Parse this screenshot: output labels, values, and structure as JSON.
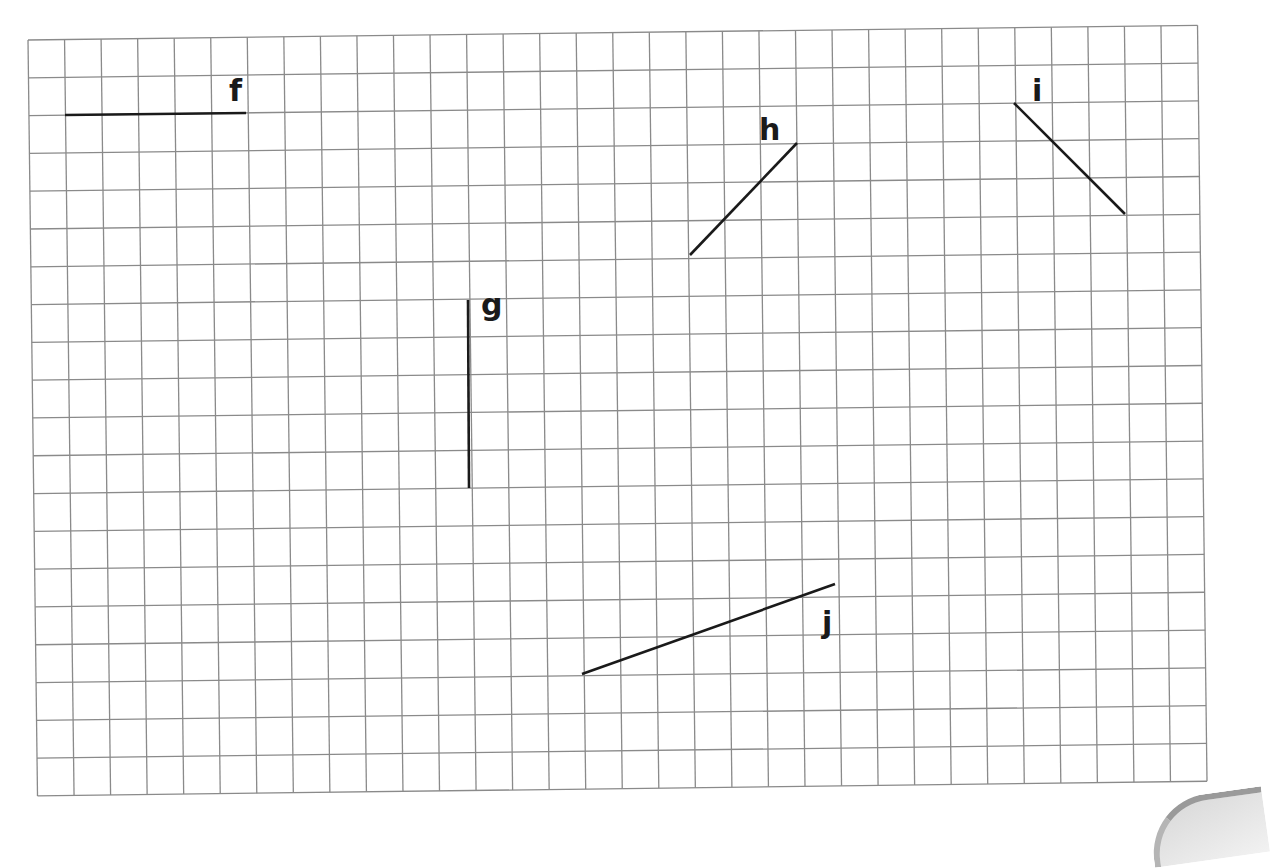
{
  "grid": {
    "origin": [
      28,
      40
    ],
    "cols": 32,
    "rows": 20,
    "cell_w": 36.55,
    "cell_h": 37.8,
    "rotation_deg": -0.72,
    "line_color": "#8a8a8a"
  },
  "segments": [
    {
      "id": "f",
      "label": "f",
      "x1": 65,
      "y1": 115,
      "x2": 246,
      "y2": 113,
      "label_x": 229,
      "label_y": 101
    },
    {
      "id": "g",
      "label": "g",
      "x1": 468,
      "y1": 300,
      "x2": 469,
      "y2": 488,
      "label_x": 481,
      "label_y": 315
    },
    {
      "id": "h",
      "label": "h",
      "x1": 690,
      "y1": 255,
      "x2": 797,
      "y2": 143,
      "label_x": 759,
      "label_y": 140
    },
    {
      "id": "i",
      "label": "i",
      "x1": 1014,
      "y1": 103,
      "x2": 1125,
      "y2": 214,
      "label_x": 1032,
      "label_y": 101
    },
    {
      "id": "j",
      "label": "j",
      "x1": 582,
      "y1": 674,
      "x2": 835,
      "y2": 584,
      "label_x": 822,
      "label_y": 633
    }
  ],
  "segment_color": "#1a1a1a"
}
